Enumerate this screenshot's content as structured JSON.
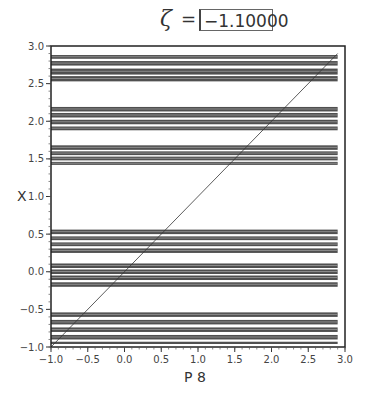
{
  "title": {
    "symbol": "ζ",
    "equals": "=",
    "value": "−1.10000"
  },
  "chart_data": {
    "type": "scatter",
    "title": "ζ = −1.10000",
    "xlabel": "P 8",
    "ylabel": "X",
    "xlim": [
      -1.0,
      3.0
    ],
    "ylim": [
      -1.0,
      3.0
    ],
    "xticks": [
      "-1.0",
      "-0.5",
      "0.0",
      "0.5",
      "1.0",
      "1.5",
      "2.0",
      "2.5",
      "3.0"
    ],
    "yticks": [
      "-1.0",
      "-0.5",
      "0.0",
      "0.5",
      "1.0",
      "1.5",
      "2.0",
      "2.5",
      "3.0"
    ],
    "grid": false,
    "legend": null,
    "reference_line": {
      "type": "diagonal",
      "from": [
        -1.0,
        -1.0
      ],
      "to": [
        2.9,
        2.9
      ]
    },
    "bands": [
      {
        "group": 1,
        "y_min": 2.83,
        "y_max": 2.88
      },
      {
        "group": 1,
        "y_min": 2.74,
        "y_max": 2.8
      },
      {
        "group": 1,
        "y_min": 2.62,
        "y_max": 2.7
      },
      {
        "group": 1,
        "y_min": 2.53,
        "y_max": 2.6
      },
      {
        "group": 2,
        "y_min": 2.13,
        "y_max": 2.19
      },
      {
        "group": 2,
        "y_min": 2.05,
        "y_max": 2.11
      },
      {
        "group": 2,
        "y_min": 1.96,
        "y_max": 2.02
      },
      {
        "group": 2,
        "y_min": 1.88,
        "y_max": 1.93
      },
      {
        "group": 3,
        "y_min": 1.62,
        "y_max": 1.68
      },
      {
        "group": 3,
        "y_min": 1.55,
        "y_max": 1.6
      },
      {
        "group": 3,
        "y_min": 1.48,
        "y_max": 1.53
      },
      {
        "group": 3,
        "y_min": 1.42,
        "y_max": 1.46
      },
      {
        "group": 4,
        "y_min": 0.5,
        "y_max": 0.56
      },
      {
        "group": 4,
        "y_min": 0.42,
        "y_max": 0.47
      },
      {
        "group": 4,
        "y_min": 0.34,
        "y_max": 0.39
      },
      {
        "group": 4,
        "y_min": 0.25,
        "y_max": 0.31
      },
      {
        "group": 5,
        "y_min": 0.05,
        "y_max": 0.11
      },
      {
        "group": 5,
        "y_min": -0.03,
        "y_max": 0.03
      },
      {
        "group": 5,
        "y_min": -0.11,
        "y_max": -0.05
      },
      {
        "group": 5,
        "y_min": -0.2,
        "y_max": -0.14
      },
      {
        "group": 6,
        "y_min": -0.6,
        "y_max": -0.54
      },
      {
        "group": 6,
        "y_min": -0.7,
        "y_max": -0.64
      },
      {
        "group": 6,
        "y_min": -0.8,
        "y_max": -0.74
      },
      {
        "group": 6,
        "y_min": -0.9,
        "y_max": -0.84
      },
      {
        "group": 6,
        "y_min": -0.96,
        "y_max": -0.93
      }
    ],
    "band_x_range": [
      -1.0,
      2.9
    ]
  },
  "colors": {
    "band": "#2a2a2a",
    "frame": "#222222",
    "background": "#ffffff"
  }
}
